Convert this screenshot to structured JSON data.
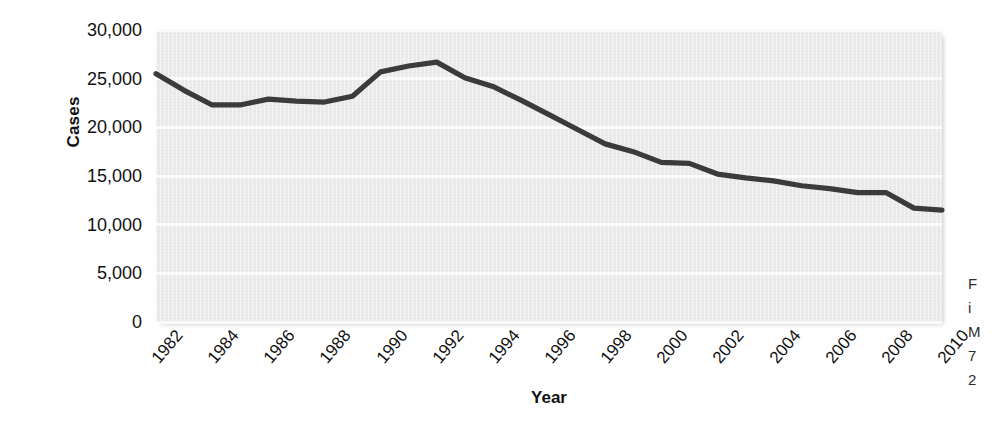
{
  "chart_data": {
    "type": "line",
    "title": "",
    "xlabel": "Year",
    "ylabel": "Cases",
    "ylim": [
      0,
      30000
    ],
    "xlim": [
      1982,
      2010
    ],
    "grid": true,
    "legend": "none",
    "y_ticks": [
      30000,
      25000,
      20000,
      15000,
      10000,
      5000,
      0
    ],
    "y_tick_labels": [
      "30,000",
      "25,000",
      "20,000",
      "15,000",
      "10,000",
      "5,000",
      "0"
    ],
    "x_tick_labels": [
      "1982",
      "1984",
      "1986",
      "1988",
      "1990",
      "1992",
      "1994",
      "1996",
      "1998",
      "2000",
      "2002",
      "2004",
      "2006",
      "2008",
      "2010"
    ],
    "x": [
      1982,
      1983,
      1984,
      1985,
      1986,
      1987,
      1988,
      1989,
      1990,
      1991,
      1992,
      1993,
      1994,
      1995,
      1996,
      1997,
      1998,
      1999,
      2000,
      2001,
      2002,
      2003,
      2004,
      2005,
      2006,
      2007,
      2008,
      2009,
      2010
    ],
    "series": [
      {
        "name": "Cases",
        "color": "#3b3b3b",
        "values": [
          25500,
          23800,
          22300,
          22300,
          22900,
          22700,
          22600,
          23200,
          25700,
          26300,
          26700,
          25100,
          24200,
          22800,
          21300,
          19800,
          18300,
          17500,
          16400,
          16300,
          15200,
          14800,
          14500,
          14000,
          13700,
          13300,
          13300,
          11700,
          11500
        ]
      }
    ]
  },
  "axes": {
    "y_title": "Cases",
    "x_title": "Year"
  },
  "caption_fragment": {
    "line1": "F",
    "line2": "i",
    "line3": "M",
    "line4": "7",
    "line5": "2"
  }
}
